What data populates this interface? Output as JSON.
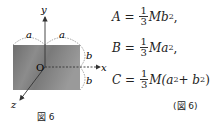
{
  "figure": {
    "caption": "図 6",
    "axis_labels": {
      "x": "x",
      "y": "y",
      "z": "z",
      "origin": "O"
    },
    "dimension_labels": {
      "half_width_left": "a",
      "half_width_right": "a",
      "half_height_top": "b",
      "half_height_bottom": "b"
    }
  },
  "equations": [
    {
      "lhs": "A",
      "eq": "=",
      "num": "1",
      "den": "3",
      "rhs_pre": "Mb",
      "sup": "2",
      "rhs_post": ","
    },
    {
      "lhs": "B",
      "eq": "=",
      "num": "1",
      "den": "3",
      "rhs_pre": "Ma",
      "sup": "2",
      "rhs_post": ","
    },
    {
      "lhs": "C",
      "eq": "=",
      "num": "1",
      "den": "3",
      "rhs_pre": "M(a",
      "sup": "2",
      "rhs_mid": " + b",
      "sup2": "2",
      "rhs_post": ")"
    }
  ],
  "equation_ref": "(図 6)"
}
